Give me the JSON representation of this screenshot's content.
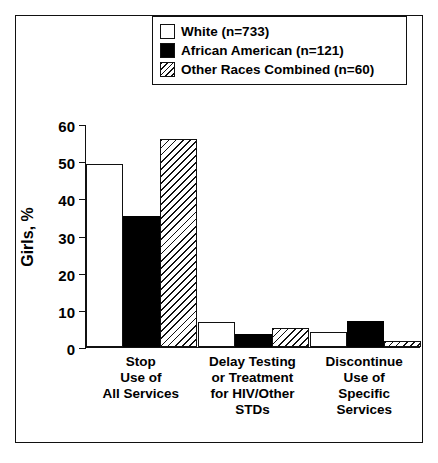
{
  "figure": {
    "background_color": "#ffffff",
    "frame_color": "#111111"
  },
  "legend": {
    "position": "top-center-inside",
    "entries": [
      {
        "label": "White (n=733)",
        "swatch": "open-white-square-icon",
        "fill": "white"
      },
      {
        "label": "African American (n=121)",
        "swatch": "filled-black-square-icon",
        "fill": "black"
      },
      {
        "label": "Other Races Combined (n=60)",
        "swatch": "diagonal-hatched-square-icon",
        "fill": "hatched"
      }
    ]
  },
  "axes": {
    "ylabel": "Girls, %",
    "yticks": [
      0,
      10,
      20,
      30,
      40,
      50,
      60
    ],
    "ytick_labels": [
      "0",
      "10",
      "20",
      "30",
      "40",
      "50",
      "60"
    ],
    "ylim": [
      0,
      60
    ],
    "xlabel": ""
  },
  "chart_data": {
    "type": "bar",
    "title": "",
    "xlabel": "",
    "ylabel": "Girls, %",
    "ylim": [
      0,
      60
    ],
    "yticks": [
      0,
      10,
      20,
      30,
      40,
      50,
      60
    ],
    "grid": false,
    "legend_position": "upper center",
    "categories": [
      "Stop\nUse of\nAll Services",
      "Delay Testing\nor Treatment\nfor HIV/Other\nSTDs",
      "Discontinue\nUse of\nSpecific\nServices"
    ],
    "series": [
      {
        "name": "White (n=733)",
        "fill": "white",
        "values": [
          49.3,
          6.7,
          4.1
        ]
      },
      {
        "name": "African American (n=121)",
        "fill": "black",
        "values": [
          35.3,
          3.4,
          7.0
        ]
      },
      {
        "name": "Other Races Combined (n=60)",
        "fill": "hatched",
        "values": [
          56.0,
          5.1,
          1.5
        ]
      }
    ]
  }
}
